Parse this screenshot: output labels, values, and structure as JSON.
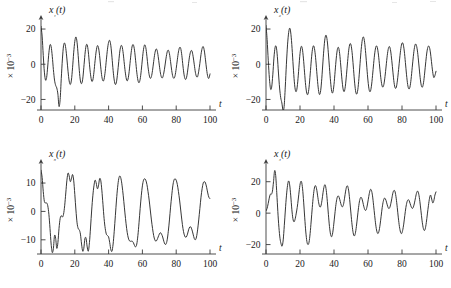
{
  "figure": {
    "background": "#ffffff",
    "line_color": "#2b2b2b",
    "axis_color": "#3a3a3a",
    "layout": "2x2 grid of time-series panels"
  },
  "chart_data": [
    {
      "type": "line",
      "panel": "top-left",
      "title": "",
      "ylabel": "x₁(t)",
      "xlabel": "t",
      "scale_note": "× 10⁻³",
      "xlim": [
        0,
        100
      ],
      "ylim": [
        -26,
        24
      ],
      "xticks": [
        0,
        20,
        40,
        60,
        80,
        100
      ],
      "xticklabels": [
        "0",
        "20",
        "40",
        "60",
        "80",
        "100"
      ],
      "yticks": [
        -20,
        0,
        20
      ],
      "yticklabels": [
        "−20",
        "0",
        "20"
      ],
      "grid": false,
      "legend": null,
      "series": [
        {
          "name": "x1",
          "values": [
            21.5,
            16.0,
            5.0,
            -4.5,
            -9.0,
            -7.5,
            -1.0,
            6.5,
            11.0,
            10.0,
            4.5,
            -3.0,
            -9.0,
            -12.0,
            -13.5,
            -17.0,
            -24.0,
            -20.0,
            -8.0,
            3.0,
            10.5,
            12.0,
            9.0,
            3.0,
            -4.0,
            -9.5,
            -11.5,
            -9.0,
            -2.0,
            6.5,
            13.0,
            15.5,
            12.5,
            5.0,
            -3.5,
            -9.5,
            -11.0,
            -8.5,
            -2.0,
            5.5,
            10.5,
            11.0,
            7.0,
            0.0,
            -6.0,
            -9.5,
            -9.0,
            -4.5,
            2.0,
            7.5,
            10.5,
            9.5,
            5.0,
            -1.5,
            -7.0,
            -9.5,
            -8.5,
            -4.0,
            2.5,
            8.5,
            12.5,
            13.5,
            10.5,
            4.0,
            -3.5,
            -9.0,
            -11.5,
            -10.0,
            -5.0,
            1.5,
            7.5,
            10.5,
            10.0,
            6.0,
            0.0,
            -5.5,
            -9.0,
            -9.0,
            -5.5,
            0.5,
            6.5,
            10.5,
            11.0,
            8.0,
            2.0,
            -4.5,
            -9.0,
            -10.5,
            -8.5,
            -3.5,
            3.0,
            8.5,
            11.0,
            9.5,
            4.5,
            -1.5,
            -6.0,
            -8.0,
            -7.0,
            -3.5,
            1.5,
            6.0,
            8.5,
            8.0,
            4.5,
            -0.5,
            -5.0,
            -7.5,
            -7.5,
            -5.0,
            -1.0,
            3.5,
            7.0,
            8.0,
            6.0,
            1.5,
            -3.5,
            -7.0,
            -8.0,
            -6.5,
            -2.5,
            2.5,
            7.0,
            9.5,
            9.0,
            5.0,
            -1.0,
            -6.0,
            -8.5,
            -8.0,
            -4.5,
            0.5,
            5.0,
            7.5,
            7.5,
            4.5,
            0.0,
            -4.5,
            -7.0,
            -7.0,
            -4.0,
            0.5,
            5.5,
            9.0,
            10.0,
            7.5,
            2.5,
            -3.0,
            -7.0,
            -8.0,
            -5.5
          ]
        }
      ]
    },
    {
      "type": "line",
      "panel": "top-right",
      "title": "",
      "ylabel": "x₂(t)",
      "xlabel": "t",
      "scale_note": "× 10⁻³",
      "xlim": [
        0,
        100
      ],
      "ylim": [
        -26,
        24
      ],
      "xticks": [
        0,
        20,
        40,
        60,
        80,
        100
      ],
      "xticklabels": [
        "0",
        "20",
        "40",
        "60",
        "80",
        "100"
      ],
      "yticks": [
        -20,
        0,
        20
      ],
      "yticklabels": [
        "−20",
        "0",
        "20"
      ],
      "grid": false,
      "legend": null,
      "series": [
        {
          "name": "x2",
          "values": [
            22.0,
            14.0,
            2.0,
            -8.0,
            -14.0,
            -13.0,
            -6.0,
            3.5,
            9.5,
            10.0,
            4.5,
            -5.0,
            -13.5,
            -19.0,
            -22.0,
            -26.0,
            -24.0,
            -13.0,
            0.0,
            11.0,
            18.0,
            20.5,
            17.0,
            9.0,
            -1.0,
            -10.0,
            -15.0,
            -15.0,
            -10.0,
            -2.0,
            6.0,
            10.0,
            9.0,
            3.5,
            -4.5,
            -12.0,
            -16.5,
            -17.0,
            -13.0,
            -5.5,
            2.5,
            8.5,
            10.5,
            8.0,
            2.0,
            -6.0,
            -13.0,
            -17.0,
            -16.0,
            -10.0,
            -1.0,
            8.0,
            14.5,
            16.5,
            13.5,
            6.5,
            -2.0,
            -10.0,
            -15.5,
            -16.0,
            -11.5,
            -4.0,
            3.5,
            8.5,
            9.5,
            6.0,
            -1.0,
            -8.5,
            -14.0,
            -15.5,
            -12.5,
            -6.0,
            1.5,
            8.0,
            11.5,
            11.0,
            6.5,
            -1.0,
            -9.0,
            -15.0,
            -17.0,
            -14.5,
            -8.0,
            0.5,
            8.5,
            14.0,
            15.5,
            12.5,
            6.0,
            -2.0,
            -9.5,
            -14.5,
            -15.5,
            -12.5,
            -6.5,
            0.5,
            6.5,
            10.0,
            10.0,
            6.5,
            0.5,
            -6.0,
            -11.0,
            -13.0,
            -11.5,
            -7.0,
            -1.0,
            5.0,
            9.0,
            10.0,
            7.5,
            2.0,
            -4.5,
            -10.5,
            -13.5,
            -13.0,
            -9.0,
            -3.0,
            3.5,
            9.0,
            12.0,
            11.5,
            7.5,
            1.0,
            -6.0,
            -11.5,
            -14.0,
            -13.0,
            -8.5,
            -2.0,
            4.5,
            9.5,
            11.5,
            10.0,
            5.5,
            -1.0,
            -7.5,
            -12.0,
            -13.0,
            -10.5,
            -5.0,
            1.5,
            7.0,
            10.0,
            10.0,
            7.0,
            1.5,
            -4.0,
            -7.5,
            -6.5,
            -4.0
          ]
        }
      ]
    },
    {
      "type": "line",
      "panel": "bottom-left",
      "title": "",
      "ylabel": "x₃(t)",
      "xlabel": "t",
      "scale_note": "× 10⁻³",
      "xlim": [
        0,
        100
      ],
      "ylim": [
        -15,
        16
      ],
      "xticks": [
        0,
        20,
        40,
        60,
        80,
        100
      ],
      "xticklabels": [
        "0",
        "20",
        "40",
        "60",
        "80",
        "100"
      ],
      "yticks": [
        -10,
        0,
        10
      ],
      "yticklabels": [
        "−10",
        "0",
        "10"
      ],
      "grid": false,
      "legend": null,
      "series": [
        {
          "name": "x3",
          "values": [
            14.5,
            12.0,
            7.0,
            3.5,
            3.0,
            3.0,
            2.0,
            -1.0,
            -6.0,
            -11.5,
            -14.5,
            -13.0,
            -8.5,
            -9.5,
            -13.0,
            -11.0,
            -6.0,
            -2.5,
            -1.5,
            -2.0,
            -1.0,
            2.0,
            6.5,
            11.0,
            13.5,
            12.5,
            10.5,
            11.5,
            13.0,
            11.0,
            6.0,
            0.5,
            -4.0,
            -6.0,
            -6.5,
            -8.0,
            -11.5,
            -14.0,
            -13.0,
            -9.5,
            -9.5,
            -12.5,
            -14.0,
            -11.0,
            -5.5,
            0.5,
            5.5,
            9.0,
            11.0,
            10.0,
            8.0,
            9.0,
            11.5,
            11.0,
            7.5,
            2.5,
            -2.5,
            -6.0,
            -8.0,
            -8.5,
            -9.0,
            -11.0,
            -13.5,
            -14.0,
            -11.5,
            -7.0,
            -1.5,
            4.0,
            8.5,
            11.5,
            12.5,
            11.5,
            9.0,
            5.5,
            1.5,
            -2.5,
            -6.0,
            -8.5,
            -10.0,
            -10.5,
            -10.5,
            -10.5,
            -11.0,
            -12.0,
            -12.5,
            -11.5,
            -8.5,
            -4.0,
            1.0,
            5.5,
            9.0,
            11.0,
            11.5,
            11.0,
            9.5,
            7.0,
            4.0,
            0.5,
            -3.0,
            -6.0,
            -8.5,
            -10.0,
            -10.5,
            -10.0,
            -9.0,
            -8.0,
            -7.5,
            -8.0,
            -9.0,
            -10.5,
            -11.5,
            -11.5,
            -10.0,
            -7.0,
            -3.0,
            1.5,
            5.5,
            9.0,
            11.0,
            11.5,
            11.0,
            9.5,
            7.0,
            4.0,
            0.5,
            -3.0,
            -6.0,
            -8.0,
            -9.0,
            -9.0,
            -8.0,
            -6.5,
            -5.5,
            -5.5,
            -6.5,
            -8.0,
            -9.5,
            -10.0,
            -9.0,
            -6.5,
            -3.0,
            1.0,
            5.0,
            8.0,
            10.0,
            10.5,
            10.0,
            8.5,
            6.5,
            5.0,
            4.5
          ]
        }
      ]
    },
    {
      "type": "line",
      "panel": "bottom-right",
      "title": "",
      "ylabel": "x₄(t)",
      "xlabel": "t",
      "scale_note": "× 10⁻³",
      "xlim": [
        0,
        100
      ],
      "ylim": [
        -26,
        30
      ],
      "xticks": [
        0,
        20,
        40,
        60,
        80,
        100
      ],
      "xticklabels": [
        "0",
        "20",
        "40",
        "60",
        "80",
        "100"
      ],
      "yticks": [
        -20,
        0,
        20
      ],
      "yticklabels": [
        "−20",
        "0",
        "20"
      ],
      "grid": false,
      "legend": null,
      "series": [
        {
          "name": "x4",
          "values": [
            1.5,
            3.0,
            6.0,
            9.5,
            12.0,
            12.0,
            14.0,
            20.0,
            27.0,
            24.0,
            13.0,
            1.0,
            -9.0,
            -16.0,
            -19.5,
            -21.0,
            -17.0,
            -8.0,
            2.0,
            11.0,
            17.5,
            20.5,
            18.0,
            11.0,
            2.5,
            -3.5,
            -5.5,
            -4.0,
            -0.5,
            3.5,
            9.0,
            15.0,
            19.5,
            20.0,
            15.5,
            7.0,
            -3.0,
            -12.0,
            -18.0,
            -20.0,
            -18.5,
            -13.0,
            -5.0,
            3.5,
            11.0,
            16.0,
            17.5,
            15.5,
            11.0,
            6.5,
            4.0,
            4.5,
            8.0,
            13.0,
            17.0,
            18.0,
            14.5,
            7.5,
            -1.0,
            -8.5,
            -13.5,
            -15.0,
            -12.5,
            -7.0,
            -0.5,
            5.5,
            9.5,
            11.0,
            10.0,
            7.5,
            5.0,
            4.0,
            5.5,
            9.5,
            14.0,
            17.0,
            17.0,
            13.5,
            7.0,
            -0.5,
            -7.5,
            -12.5,
            -14.5,
            -13.0,
            -8.5,
            -2.5,
            3.5,
            8.0,
            10.0,
            9.5,
            7.0,
            4.0,
            2.0,
            2.0,
            4.5,
            8.5,
            12.5,
            15.0,
            14.5,
            11.0,
            5.0,
            -1.5,
            -7.5,
            -11.5,
            -13.0,
            -11.5,
            -7.5,
            -2.0,
            3.5,
            7.5,
            9.5,
            9.0,
            7.0,
            4.5,
            3.0,
            3.5,
            6.0,
            9.5,
            13.0,
            14.5,
            13.5,
            9.5,
            3.5,
            -3.0,
            -8.5,
            -12.0,
            -13.0,
            -11.0,
            -7.0,
            -1.5,
            3.5,
            7.0,
            8.5,
            8.0,
            6.0,
            4.0,
            3.0,
            4.0,
            6.5,
            10.0,
            13.0,
            14.0,
            12.0,
            7.5,
            1.5,
            -4.5,
            -9.0,
            -11.0,
            -10.0,
            -6.0,
            -0.5,
            5.0,
            9.5,
            11.5,
            9.0,
            6.5,
            8.0,
            11.5,
            13.5
          ]
        }
      ]
    }
  ]
}
